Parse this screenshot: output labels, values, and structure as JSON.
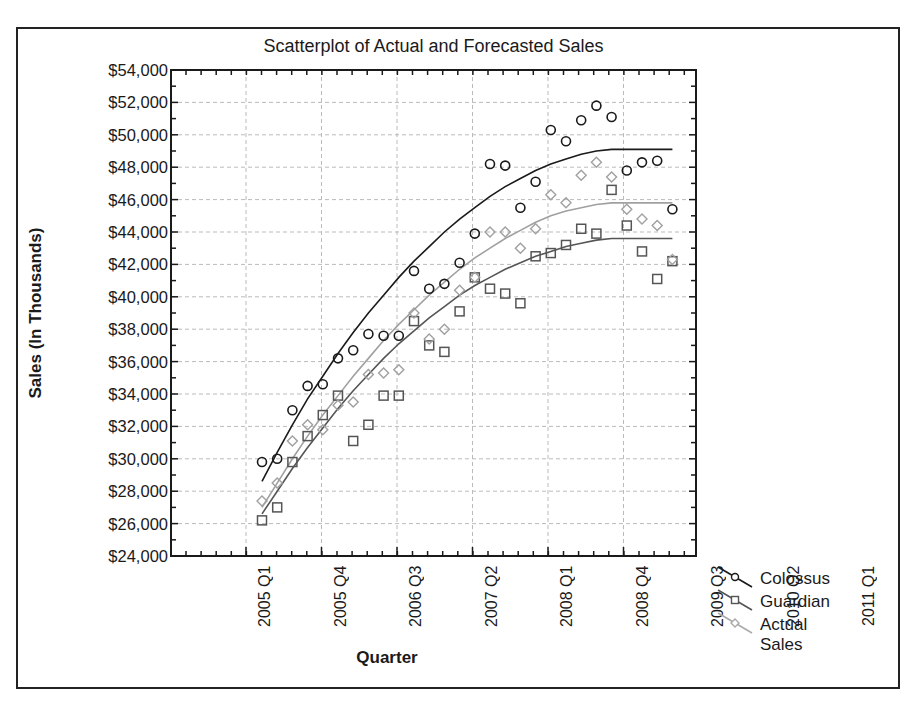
{
  "chart_data": {
    "type": "scatter",
    "title": "Scatterplot of Actual and Forecasted Sales",
    "xlabel": "Quarter",
    "ylabel": "Sales (In Thousands)",
    "ylim": [
      24000,
      54000
    ],
    "grid": true,
    "legend_position": "lower-right outside",
    "y_ticks": [
      "$54,000",
      "$52,000",
      "$50,000",
      "$48,000",
      "$46,000",
      "$44,000",
      "$42,000",
      "$40,000",
      "$38,000",
      "$36,000",
      "$34,000",
      "$32,000",
      "$30,000",
      "$28,000",
      "$26,000",
      "$24,000"
    ],
    "x_ticks": [
      "2005 Q1",
      "2005 Q4",
      "2006 Q3",
      "2007 Q2",
      "2008 Q1",
      "2008 Q4",
      "2009 Q3",
      "2010 Q2",
      "2011 Q1",
      "2011 Q4"
    ],
    "x": [
      "2005 Q1",
      "2005 Q2",
      "2005 Q3",
      "2005 Q4",
      "2006 Q1",
      "2006 Q2",
      "2006 Q3",
      "2006 Q4",
      "2007 Q1",
      "2007 Q2",
      "2007 Q3",
      "2007 Q4",
      "2008 Q1",
      "2008 Q2",
      "2008 Q3",
      "2008 Q4",
      "2009 Q1",
      "2009 Q2",
      "2009 Q3",
      "2009 Q4",
      "2010 Q1",
      "2010 Q2",
      "2010 Q3",
      "2010 Q4",
      "2011 Q1",
      "2011 Q2",
      "2011 Q3",
      "2011 Q4"
    ],
    "series": [
      {
        "name": "Colossus",
        "marker": "circle",
        "color": "#1a1a1a",
        "values": [
          29800,
          30000,
          33000,
          34500,
          34600,
          36200,
          36700,
          37700,
          37600,
          37600,
          41600,
          40500,
          40800,
          42100,
          43900,
          48200,
          48100,
          45500,
          47100,
          50300,
          49600,
          50900,
          51800,
          51100,
          47800,
          48300,
          48400,
          45400
        ],
        "trend": [
          28600,
          30400,
          32100,
          33700,
          35100,
          36500,
          37800,
          39000,
          40100,
          41200,
          42200,
          43100,
          44000,
          44800,
          45500,
          46200,
          46800,
          47300,
          47800,
          48200,
          48500,
          48800,
          49000,
          49100,
          49100,
          49100,
          49100,
          49100
        ]
      },
      {
        "name": "Guardian",
        "marker": "square",
        "color": "#555555",
        "values": [
          26200,
          27000,
          29800,
          31400,
          32700,
          33900,
          31100,
          32100,
          33900,
          33900,
          38500,
          37000,
          36600,
          39100,
          41200,
          40500,
          40200,
          39600,
          42500,
          42700,
          43200,
          44200,
          43900,
          46600,
          44400,
          42800,
          41100,
          42200
        ],
        "trend": [
          26600,
          28000,
          29400,
          30700,
          31900,
          33100,
          34200,
          35200,
          36200,
          37100,
          37900,
          38700,
          39400,
          40100,
          40700,
          41200,
          41700,
          42100,
          42500,
          42800,
          43100,
          43300,
          43500,
          43600,
          43600,
          43600,
          43600,
          43600
        ]
      },
      {
        "name": "Actual Sales",
        "marker": "diamond",
        "color": "#a0a0a0",
        "values": [
          27400,
          28500,
          31100,
          32100,
          31800,
          33300,
          33500,
          35200,
          35300,
          35500,
          39000,
          37400,
          38000,
          40400,
          41200,
          44000,
          44000,
          43000,
          44200,
          46300,
          45800,
          47500,
          48300,
          47400,
          45400,
          44800,
          44400,
          42300
        ],
        "trend": [
          27000,
          28500,
          30000,
          31400,
          32700,
          33900,
          35100,
          36200,
          37300,
          38300,
          39200,
          40100,
          40900,
          41700,
          42400,
          43000,
          43600,
          44100,
          44600,
          45000,
          45300,
          45500,
          45700,
          45800,
          45800,
          45800,
          45800,
          45800
        ]
      }
    ]
  },
  "legend": {
    "items": [
      {
        "label": "Colossus"
      },
      {
        "label": "Guardian"
      },
      {
        "label": "Actual Sales"
      }
    ]
  }
}
